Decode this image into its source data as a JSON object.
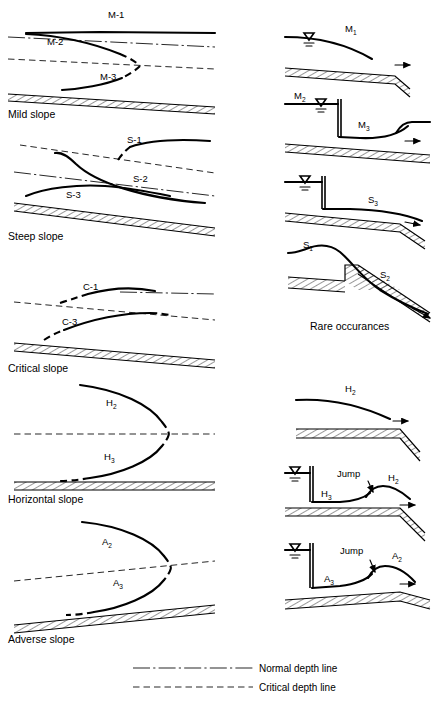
{
  "figure": {
    "left_column_heading": "",
    "right_column_note": "Rare occurances"
  },
  "sections": [
    {
      "id": "mild",
      "caption": "Mild slope",
      "profiles": [
        "M-1",
        "M-2",
        "M-3"
      ],
      "examples": [
        "M1",
        "M2",
        "M3"
      ]
    },
    {
      "id": "steep",
      "caption": "Steep slope",
      "profiles": [
        "S-1",
        "S-2",
        "S-3"
      ],
      "examples": [
        "S3",
        "S1",
        "S2"
      ]
    },
    {
      "id": "critical",
      "caption": "Critical slope",
      "profiles": [
        "C-1",
        "C-3"
      ],
      "examples": []
    },
    {
      "id": "horizontal",
      "caption": "Horizontal slope",
      "profiles": [
        "H2",
        "H3"
      ],
      "examples": [
        "H2",
        "H3",
        "H2"
      ]
    },
    {
      "id": "adverse",
      "caption": "Adverse slope",
      "profiles": [
        "A2",
        "A3"
      ],
      "examples": [
        "A3",
        "A2"
      ]
    }
  ],
  "labels": {
    "m1": "M-1",
    "m2": "M-2",
    "m3": "M-3",
    "s1": "S-1",
    "s2": "S-2",
    "s3": "S-3",
    "c1": "C-1",
    "c3": "C-3",
    "h2_base": "H",
    "h2_sub": "2",
    "h3_base": "H",
    "h3_sub": "3",
    "a2_base": "A",
    "a2_sub": "2",
    "a3_base": "A",
    "a3_sub": "3",
    "ex_m1_base": "M",
    "ex_m1_sub": "1",
    "ex_m2_base": "M",
    "ex_m2_sub": "2",
    "ex_m3_base": "M",
    "ex_m3_sub": "3",
    "ex_s3_base": "S",
    "ex_s3_sub": "3",
    "ex_s1_base": "S",
    "ex_s1_sub": "1",
    "ex_s2_base": "S",
    "ex_s2_sub": "2",
    "jump": "Jump"
  },
  "captions": {
    "mild": "Mild slope",
    "steep": "Steep slope",
    "critical": "Critical slope",
    "horizontal": "Horizontal slope",
    "adverse": "Adverse slope",
    "rare": "Rare occurances"
  },
  "legend": {
    "items": [
      {
        "label": "Normal depth line",
        "style": "dash-dot"
      },
      {
        "label": "Critical depth line",
        "style": "dashed"
      }
    ]
  },
  "colors": {
    "ink": "#000000",
    "paper": "#ffffff"
  }
}
